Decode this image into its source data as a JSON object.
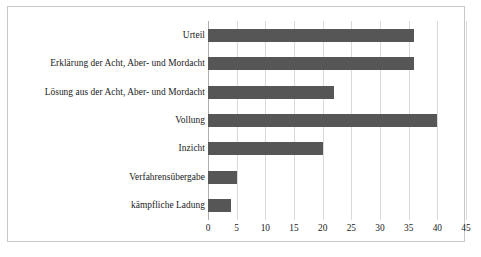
{
  "chart_data": {
    "type": "bar",
    "orientation": "horizontal",
    "title": "",
    "subtitle": "",
    "xlabel": "",
    "ylabel": "",
    "xlim": [
      0,
      45
    ],
    "xticks": [
      0,
      5,
      10,
      15,
      20,
      25,
      30,
      35,
      40,
      45
    ],
    "tick_labels": [
      "0",
      "5",
      "10",
      "15",
      "20",
      "25",
      "30",
      "35",
      "40",
      "45"
    ],
    "grid": true,
    "legend": false,
    "legend_position": "none",
    "bar_color": "#565656",
    "gridline_color": "#d9d9d9",
    "frame_color": "#c8c8c8",
    "background_color": "#ffffff",
    "categories": [
      "Urteil",
      "Erklärung der Acht, Aber- und Mordacht",
      "Lösung aus der Acht, Aber- und Mordacht",
      "Vollung",
      "Inzicht",
      "Verfahrensübergabe",
      "kämpfliche Ladung"
    ],
    "values": [
      36,
      36,
      22,
      40,
      20,
      5,
      4
    ]
  }
}
